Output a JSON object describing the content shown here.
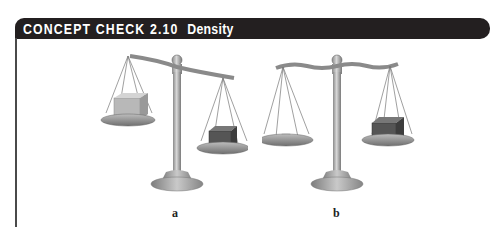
{
  "header": {
    "prefix": "CONCEPT CHECK 2.10",
    "title": "Density"
  },
  "figures": [
    {
      "label": "a",
      "description": "Balance tipped: left pan higher with larger light cube, right pan lower with smaller dark cube"
    },
    {
      "label": "b",
      "description": "Balance level: left pan with thin light slab, right pan with larger dark cube"
    }
  ],
  "colors": {
    "header_bg": "#231f20",
    "header_text": "#ffffff"
  }
}
